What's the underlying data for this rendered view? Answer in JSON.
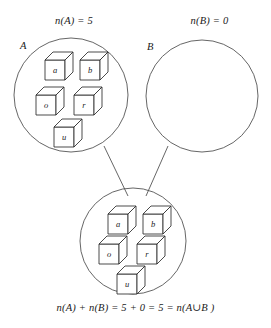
{
  "diagram": {
    "labels": {
      "n_a": "n(A) = 5",
      "n_b": "n(B) = 0",
      "set_a": "A",
      "set_b": "B"
    },
    "caption": "n(A) + n(B) = 5 + 0 = 5 = n(A∪B )",
    "sets": {
      "a": {
        "name": "A",
        "count": 5,
        "elements": [
          "a",
          "b",
          "o",
          "r",
          "u"
        ]
      },
      "b": {
        "name": "B",
        "count": 0,
        "elements": []
      },
      "union": {
        "name": "A∪B",
        "count": 5,
        "elements": [
          "a",
          "b",
          "o",
          "r",
          "u"
        ]
      }
    },
    "colors": {
      "outline": "#4a4a4a",
      "cube_stroke": "#2b2b2b",
      "cube_fill": "#ffffff",
      "text": "#1a1a1a",
      "background": "#ffffff"
    }
  }
}
